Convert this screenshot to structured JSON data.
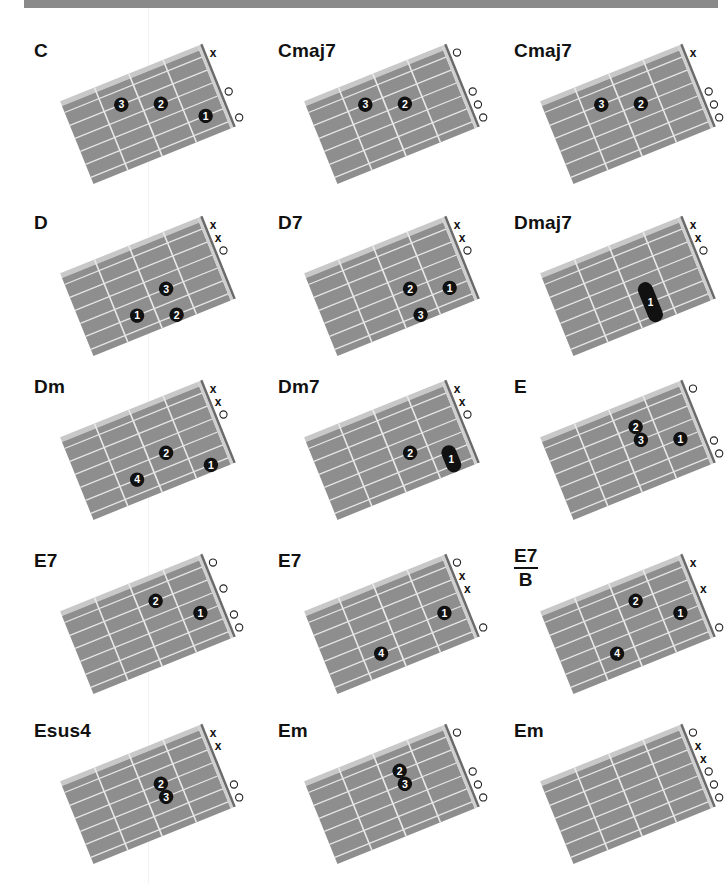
{
  "colors": {
    "fretboard": "#8e8e8e",
    "fretboard_top_edge": "#c8c8c8",
    "string": "#e6e6e6",
    "fret": "#e9e9e9",
    "nut_dark": "#6a6a6a",
    "nut_light": "#d0d0d0",
    "finger": "#111111",
    "finger_text": "#ffffff",
    "top_bar": "#8a8a8a"
  },
  "legend": {
    "strings_top_to_bottom": [
      "E",
      "A",
      "D",
      "G",
      "B",
      "e"
    ],
    "fret_count": 4,
    "open_marker": "○",
    "mute_marker": "x"
  },
  "chords": [
    {
      "name": "C",
      "markers": [
        "x",
        "",
        "",
        "o",
        "",
        "o"
      ],
      "fingers": [
        {
          "string": 1,
          "fret": 3,
          "label": "3"
        },
        {
          "string": 2,
          "fret": 2,
          "label": "2"
        },
        {
          "string": 4,
          "fret": 1,
          "label": "1"
        }
      ]
    },
    {
      "name": "Cmaj7",
      "markers": [
        "o",
        "",
        "",
        "o",
        "o",
        "o"
      ],
      "fingers": [
        {
          "string": 1,
          "fret": 3,
          "label": "3"
        },
        {
          "string": 2,
          "fret": 2,
          "label": "2"
        }
      ]
    },
    {
      "name": "Cmaj7",
      "markers": [
        "x",
        "",
        "",
        "o",
        "o",
        "o"
      ],
      "fingers": [
        {
          "string": 1,
          "fret": 3,
          "label": "3"
        },
        {
          "string": 2,
          "fret": 2,
          "label": "2"
        }
      ]
    },
    {
      "name": "D",
      "markers": [
        "x",
        "x",
        "o",
        "",
        "",
        ""
      ],
      "fingers": [
        {
          "string": 3,
          "fret": 2,
          "label": "3"
        },
        {
          "string": 4,
          "fret": 3,
          "label": "1"
        },
        {
          "string": 5,
          "fret": 2,
          "label": "2"
        }
      ]
    },
    {
      "name": "D7",
      "markers": [
        "x",
        "x",
        "o",
        "",
        "",
        ""
      ],
      "fingers": [
        {
          "string": 3,
          "fret": 2,
          "label": "2"
        },
        {
          "string": 4,
          "fret": 1,
          "label": "1"
        },
        {
          "string": 5,
          "fret": 2,
          "label": "3"
        }
      ]
    },
    {
      "name": "Dmaj7",
      "markers": [
        "x",
        "x",
        "o",
        "",
        "",
        ""
      ],
      "barre": {
        "from_string": 3,
        "to_string": 5,
        "fret": 2,
        "label": "1"
      },
      "fingers": []
    },
    {
      "name": "Dm",
      "markers": [
        "x",
        "x",
        "o",
        "",
        "",
        ""
      ],
      "fingers": [
        {
          "string": 3,
          "fret": 2,
          "label": "2"
        },
        {
          "string": 4,
          "fret": 3,
          "label": "4"
        },
        {
          "string": 5,
          "fret": 1,
          "label": "1"
        }
      ]
    },
    {
      "name": "Dm7",
      "markers": [
        "x",
        "x",
        "o",
        "",
        "",
        ""
      ],
      "fingers": [
        {
          "string": 3,
          "fret": 2,
          "label": "2"
        }
      ],
      "barre": {
        "from_string": 4,
        "to_string": 5,
        "fret": 1,
        "label": "1"
      }
    },
    {
      "name": "E",
      "markers": [
        "o",
        "",
        "",
        "",
        "o",
        "o"
      ],
      "fingers": [
        {
          "string": 1,
          "fret": 2,
          "label": "2"
        },
        {
          "string": 2,
          "fret": 2,
          "label": "3"
        },
        {
          "string": 3,
          "fret": 1,
          "label": "1"
        }
      ]
    },
    {
      "name": "E7",
      "markers": [
        "o",
        "",
        "o",
        "",
        "o",
        "o"
      ],
      "fingers": [
        {
          "string": 1,
          "fret": 2,
          "label": "2"
        },
        {
          "string": 3,
          "fret": 1,
          "label": "1"
        }
      ]
    },
    {
      "name": "E7",
      "markers": [
        "o",
        "x",
        "x",
        "",
        "",
        "o"
      ],
      "fingers": [
        {
          "string": 3,
          "fret": 1,
          "label": "1"
        },
        {
          "string": 4,
          "fret": 3,
          "label": "4"
        }
      ]
    },
    {
      "name": "E7",
      "bass": "B",
      "markers": [
        "x",
        "",
        "x",
        "",
        "",
        "o"
      ],
      "fingers": [
        {
          "string": 1,
          "fret": 2,
          "label": "2"
        },
        {
          "string": 3,
          "fret": 1,
          "label": "1"
        },
        {
          "string": 4,
          "fret": 3,
          "label": "4"
        }
      ]
    },
    {
      "name": "Esus4",
      "markers": [
        "x",
        "x",
        "",
        "",
        "o",
        "o"
      ],
      "fingers": [
        {
          "string": 2,
          "fret": 2,
          "label": "2"
        },
        {
          "string": 3,
          "fret": 2,
          "label": "3"
        }
      ]
    },
    {
      "name": "Em",
      "markers": [
        "o",
        "",
        "",
        "o",
        "o",
        "o"
      ],
      "fingers": [
        {
          "string": 1,
          "fret": 2,
          "label": "2"
        },
        {
          "string": 2,
          "fret": 2,
          "label": "3"
        }
      ]
    },
    {
      "name": "Em",
      "markers": [
        "o",
        "x",
        "x",
        "o",
        "o",
        "o"
      ],
      "fingers": []
    }
  ]
}
